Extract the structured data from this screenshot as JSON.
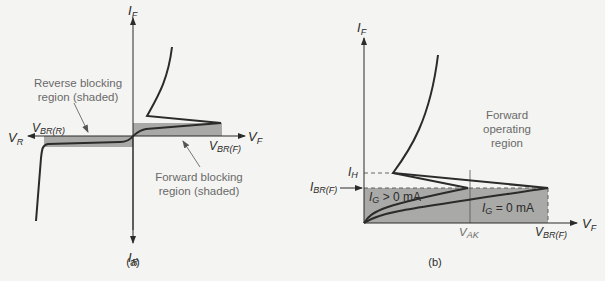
{
  "panel_a": {
    "caption": "(a)",
    "axes": {
      "y_pos": "I",
      "y_pos_sub": "F",
      "y_neg": "I",
      "y_neg_sub": "R",
      "x_pos": "V",
      "x_pos_sub": "F",
      "x_neg": "V",
      "x_neg_sub": "R"
    },
    "labels": {
      "vbr_r": "V",
      "vbr_r_sub": "BR(R)",
      "vbr_f": "V",
      "vbr_f_sub": "BR(F)"
    },
    "annotations": {
      "reverse_line1": "Reverse blocking",
      "reverse_line2": "region (shaded)",
      "forward_line1": "Forward blocking",
      "forward_line2": "region (shaded)"
    }
  },
  "panel_b": {
    "caption": "(b)",
    "axes": {
      "y_pos": "I",
      "y_pos_sub": "F",
      "x_pos": "V",
      "x_pos_sub": "F"
    },
    "labels": {
      "ih": "I",
      "ih_sub": "H",
      "ibr": "I",
      "ibr_sub": "BR(F)",
      "vak": "V",
      "vak_sub": "AK",
      "vbr_f": "V",
      "vbr_f_sub": "BR(F)",
      "ig_pos": "I",
      "ig_pos_sub": "G",
      "ig_pos_val": " > 0 mA",
      "ig_zero": "I",
      "ig_zero_sub": "G",
      "ig_zero_val": " = 0 mA"
    },
    "annotations": {
      "region_line1": "Forward",
      "region_line2": "operating",
      "region_line3": "region"
    }
  },
  "colors": {
    "background": "#f4f4f2",
    "shading": "#a9a9a7",
    "curve": "#2b2b2b",
    "accent_text": "#6a6a6a"
  }
}
